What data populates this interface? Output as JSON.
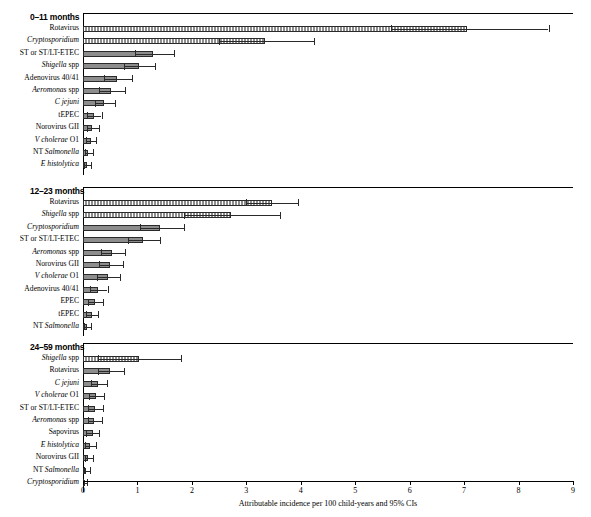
{
  "chart_data": {
    "type": "bar",
    "orientation": "horizontal",
    "title": "",
    "xlabel": "Attributable incidence per 100 child-years and 95% CIs",
    "ylabel": "",
    "xlim": [
      0,
      9
    ],
    "xticks": [
      0,
      1,
      2,
      3,
      4,
      5,
      6,
      7,
      8,
      9
    ],
    "grid": false,
    "legend": "none",
    "panels": [
      {
        "title": "0–11 months",
        "categories": [
          "Rotavirus",
          "Cryptosporidium",
          "ST or ST/LT-ETEC",
          "Shigella spp",
          "Adenovirus 40/41",
          "Aeromonas spp",
          "C jejuni",
          "tEPEC",
          "Norovirus GII",
          "V cholerae O1",
          "NT Salmonella",
          "E histolytica"
        ],
        "italic_flags": [
          false,
          true,
          false,
          true,
          false,
          true,
          true,
          false,
          false,
          true,
          true,
          true
        ],
        "highlight": [
          true,
          true,
          false,
          false,
          false,
          false,
          false,
          false,
          false,
          false,
          false,
          false
        ],
        "values": [
          7.05,
          3.35,
          1.28,
          1.02,
          0.62,
          0.52,
          0.38,
          0.2,
          0.17,
          0.14,
          0.1,
          0.07
        ],
        "ci_low": [
          5.65,
          2.5,
          0.95,
          0.75,
          0.38,
          0.3,
          0.22,
          0.08,
          0.07,
          0.06,
          0.04,
          0.02
        ],
        "ci_high": [
          8.55,
          4.25,
          1.68,
          1.32,
          0.9,
          0.78,
          0.58,
          0.34,
          0.29,
          0.24,
          0.18,
          0.14
        ]
      },
      {
        "title": "12–23 months",
        "categories": [
          "Rotavirus",
          "Shigella spp",
          "Cryptosporidium",
          "ST or ST/LT-ETEC",
          "Aeromonas spp",
          "Norovirus GII",
          "V cholerae O1",
          "Adenovirus 40/41",
          "EPEC",
          "tEPEC",
          "NT Salmonella"
        ],
        "italic_flags": [
          false,
          true,
          true,
          false,
          true,
          false,
          true,
          false,
          false,
          false,
          true
        ],
        "highlight": [
          true,
          true,
          false,
          false,
          false,
          false,
          false,
          false,
          false,
          false,
          false
        ],
        "values": [
          3.48,
          2.72,
          1.42,
          1.1,
          0.54,
          0.5,
          0.46,
          0.28,
          0.22,
          0.16,
          0.08
        ],
        "ci_low": [
          3.0,
          1.85,
          1.05,
          0.82,
          0.33,
          0.3,
          0.26,
          0.13,
          0.1,
          0.06,
          0.02
        ],
        "ci_high": [
          3.95,
          3.62,
          1.85,
          1.42,
          0.78,
          0.73,
          0.68,
          0.45,
          0.36,
          0.27,
          0.15
        ]
      },
      {
        "title": "24–59 months",
        "categories": [
          "Shigella spp",
          "Rotavirus",
          "C jejuni",
          "V cholerae O1",
          "ST or ST/LT-ETEC",
          "Aeromonas spp",
          "Sapovirus",
          "E histolytica",
          "Norovirus GII",
          "NT Salmonella",
          "Cryptosporidium"
        ],
        "italic_flags": [
          true,
          false,
          true,
          true,
          false,
          true,
          false,
          true,
          false,
          true,
          true
        ],
        "highlight": [
          true,
          false,
          false,
          false,
          false,
          false,
          false,
          false,
          false,
          false,
          false
        ],
        "values": [
          1.02,
          0.5,
          0.28,
          0.24,
          0.22,
          0.21,
          0.18,
          0.13,
          0.1,
          0.06,
          0.03
        ],
        "ci_low": [
          0.28,
          0.28,
          0.14,
          0.11,
          0.1,
          0.09,
          0.06,
          0.04,
          0.03,
          0.01,
          0.0
        ],
        "ci_high": [
          1.8,
          0.76,
          0.44,
          0.38,
          0.36,
          0.34,
          0.3,
          0.24,
          0.19,
          0.12,
          0.08
        ]
      }
    ]
  }
}
